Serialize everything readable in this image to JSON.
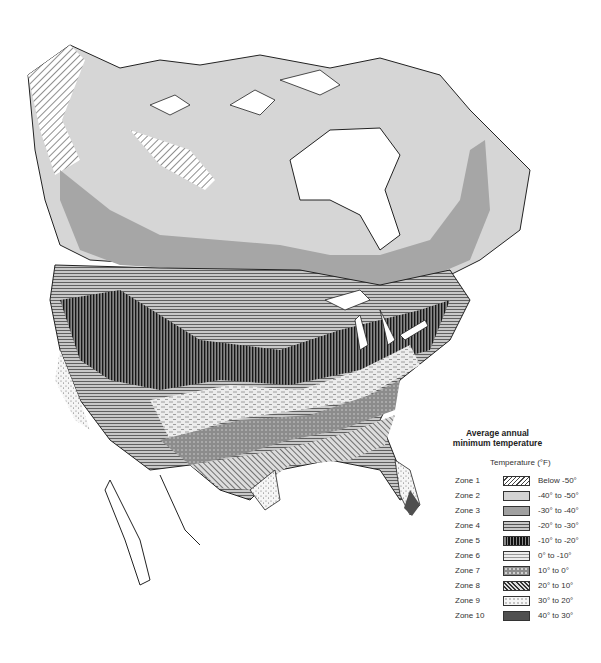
{
  "legend": {
    "title_line1": "Average annual",
    "title_line2": "minimum temperature",
    "subtitle": "Temperature (°F)",
    "zones": [
      {
        "zone": "Zone 1",
        "range": "Below -50°",
        "pattern": "diagonal-hatch-light",
        "color": "#ffffff"
      },
      {
        "zone": "Zone 2",
        "range": "-40° to -50°",
        "pattern": "solid",
        "color": "#d4d4d4"
      },
      {
        "zone": "Zone 3",
        "range": "-30° to -40°",
        "pattern": "solid",
        "color": "#a0a0a0"
      },
      {
        "zone": "Zone 4",
        "range": "-20° to -30°",
        "pattern": "horizontal-lines",
        "color": "#b4b4b4"
      },
      {
        "zone": "Zone 5",
        "range": "-10° to -20°",
        "pattern": "vertical-lines-dark",
        "color": "#555555"
      },
      {
        "zone": "Zone 6",
        "range": "0° to -10°",
        "pattern": "dashes-light",
        "color": "#e6e6e6"
      },
      {
        "zone": "Zone 7",
        "range": "10° to 0°",
        "pattern": "dotted-grid",
        "color": "#8c8c8c"
      },
      {
        "zone": "Zone 8",
        "range": "20° to 10°",
        "pattern": "diagonal-hatch",
        "color": "#c8c8c8"
      },
      {
        "zone": "Zone 9",
        "range": "30° to 20°",
        "pattern": "stipple",
        "color": "#f4f4f4"
      },
      {
        "zone": "Zone 10",
        "range": "40° to 30°",
        "pattern": "solid",
        "color": "#505050"
      }
    ]
  }
}
